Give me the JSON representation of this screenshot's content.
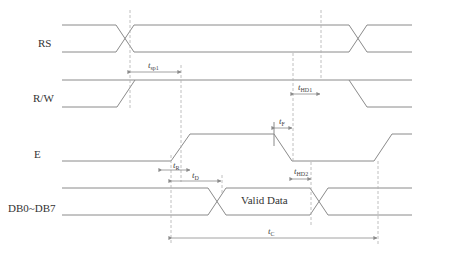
{
  "signals": [
    {
      "name": "RS"
    },
    {
      "name": "R/W"
    },
    {
      "name": "E"
    },
    {
      "name": "DB0~DB7"
    }
  ],
  "data_label": "Valid Data",
  "timing_params": [
    {
      "t": "t",
      "sub": "sp1"
    },
    {
      "t": "t",
      "sub": "HD1"
    },
    {
      "t": "t",
      "sub": "F"
    },
    {
      "t": "t",
      "sub": "R"
    },
    {
      "t": "t",
      "sub": "D"
    },
    {
      "t": "t",
      "sub": "HD2"
    },
    {
      "t": "t",
      "sub": "C"
    }
  ],
  "caption": "图 ... 读操作时序"
}
